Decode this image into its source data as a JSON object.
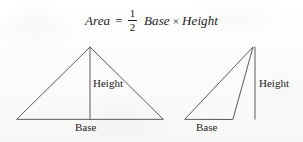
{
  "figure": {
    "name": "area-of-a-triangle",
    "background_color": "#fcfcfb",
    "stroke_color": "#5a5a5c",
    "text_color": "#1a1a1a"
  },
  "formula": {
    "area_term": "Area",
    "equals": "=",
    "fraction_numerator": "1",
    "fraction_denominator": "2",
    "base_term": "Base",
    "multiply_symbol": "×",
    "height_term": "Height"
  },
  "diagrams": [
    {
      "id": "left-triangle",
      "type": "acute-isosceles-triangle",
      "height_label": "Height",
      "base_label": "Base",
      "vertices": [
        [
          17,
          119
        ],
        [
          90,
          47
        ],
        [
          163,
          119
        ]
      ],
      "height_line": [
        [
          90,
          47
        ],
        [
          90,
          119
        ]
      ]
    },
    {
      "id": "right-triangle",
      "type": "obtuse-triangle",
      "height_label": "Height",
      "base_label": "Base",
      "vertices": [
        [
          185,
          119
        ],
        [
          253,
          47
        ],
        [
          233,
          119
        ]
      ],
      "height_line": [
        [
          255,
          47
        ],
        [
          255,
          119
        ]
      ]
    }
  ]
}
